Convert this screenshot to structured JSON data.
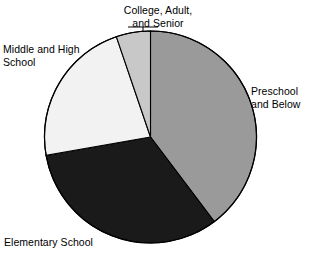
{
  "chart_data": {
    "type": "pie",
    "title": "",
    "subtitle": "",
    "xlabel": "",
    "ylabel": "",
    "legend_position": "none",
    "grid": false,
    "labels_placement": "outside-with-leader-lines",
    "categories": [
      "Preschool and Below",
      "Elementary School",
      "Middle and High School",
      "College, Adult, and Senior"
    ],
    "values": [
      39.7,
      32.5,
      22.6,
      5.2
    ],
    "units": "percent",
    "start_angle_deg": 0,
    "direction": "clockwise",
    "slices": [
      {
        "name": "Preschool and Below",
        "label_line1": "Preschool",
        "label_line2": "and Below",
        "value": 39.7,
        "start_deg": 0,
        "end_deg": 143,
        "color": "#9a9a9a"
      },
      {
        "name": "Elementary School",
        "label_line1": "Elementary School",
        "label_line2": "",
        "value": 32.5,
        "start_deg": 143,
        "end_deg": 260,
        "color": "#1a1a1a"
      },
      {
        "name": "Middle and High School",
        "label_line1": "Middle and High",
        "label_line2": "School",
        "value": 22.6,
        "start_deg": 260,
        "end_deg": 341.2,
        "color": "#f2f2f2"
      },
      {
        "name": "College, Adult, and Senior",
        "label_line1": "College, Adult,",
        "label_line2": "and Senior",
        "value": 5.2,
        "start_deg": 341.2,
        "end_deg": 360,
        "color": "#c8c8c8"
      }
    ]
  },
  "labels": {
    "college": "College, Adult,\nand Senior",
    "middle_high": "Middle and High\nSchool",
    "preschool": "Preschool\nand Below",
    "elementary": "Elementary School"
  },
  "colors": {
    "preschool": "#9a9a9a",
    "elementary": "#1a1a1a",
    "middle_high": "#f2f2f2",
    "college": "#c8c8c8",
    "outline": "#000000",
    "background": "#ffffff",
    "text": "#000000"
  }
}
